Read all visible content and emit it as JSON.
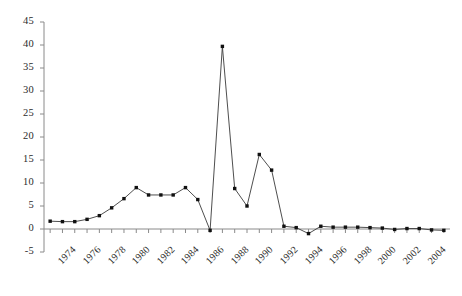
{
  "chart_data": {
    "type": "line",
    "title": "",
    "subtitle": "",
    "xlabel": "",
    "ylabel": "",
    "x": [
      1973,
      1974,
      1975,
      1976,
      1977,
      1978,
      1979,
      1980,
      1981,
      1982,
      1983,
      1984,
      1985,
      1986,
      1987,
      1988,
      1989,
      1990,
      1991,
      1992,
      1993,
      1994,
      1995,
      1996,
      1997,
      1998,
      1999,
      2000,
      2001,
      2002,
      2003,
      2004,
      2005
    ],
    "values": [
      1.7,
      1.6,
      1.6,
      2.1,
      2.9,
      4.6,
      6.6,
      9.0,
      7.4,
      7.4,
      7.4,
      9.0,
      6.4,
      -0.3,
      39.7,
      8.8,
      5.0,
      16.2,
      12.8,
      0.6,
      0.3,
      -1.0,
      0.6,
      0.4,
      0.4,
      0.4,
      0.3,
      0.2,
      -0.1,
      0.1,
      0.1,
      -0.2,
      -0.3
    ],
    "series": [
      {
        "name": "series-1",
        "values": [
          1.7,
          1.6,
          1.6,
          2.1,
          2.9,
          4.6,
          6.6,
          9.0,
          7.4,
          7.4,
          7.4,
          9.0,
          6.4,
          -0.3,
          39.7,
          8.8,
          5.0,
          16.2,
          12.8,
          0.6,
          0.3,
          -1.0,
          0.6,
          0.4,
          0.4,
          0.4,
          0.3,
          0.2,
          -0.1,
          0.1,
          0.1,
          -0.2,
          -0.3
        ],
        "color": "#000000",
        "marker": "square",
        "line_width": 1
      }
    ],
    "ylim": [
      -5,
      45
    ],
    "ytick_values": [
      -5,
      0,
      5,
      10,
      15,
      20,
      25,
      30,
      35,
      40,
      45
    ],
    "ytick_labels": [
      "-5",
      "0",
      "5",
      "10",
      "15",
      "20",
      "25",
      "30",
      "35",
      "40",
      "45"
    ],
    "xlim": [
      1972.5,
      2005.5
    ],
    "xtick_values": [
      1974,
      1976,
      1978,
      1980,
      1982,
      1984,
      1986,
      1988,
      1990,
      1992,
      1994,
      1996,
      1998,
      2000,
      2002,
      2004
    ],
    "xtick_labels": [
      "1974",
      "1976",
      "1978",
      "1980",
      "1982",
      "1984",
      "1986",
      "1988",
      "1990",
      "1992",
      "1994",
      "1996",
      "1998",
      "2000",
      "2002",
      "2004"
    ],
    "grid": false,
    "legend": false,
    "legend_position": "none",
    "annotations": [],
    "axis_color": "#808080",
    "text_color": "#2b2b2b",
    "background": "#ffffff"
  }
}
